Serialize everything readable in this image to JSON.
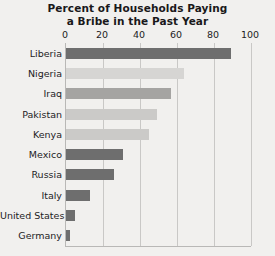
{
  "chart_data": {
    "type": "bar",
    "orientation": "horizontal",
    "title": "Percent of Households Paying a Bribe in the Past Year",
    "title_lines": [
      "Percent of Households Paying",
      "a Bribe in the Past Year"
    ],
    "xlabel": "",
    "ylabel": "",
    "xlim": [
      0,
      100
    ],
    "xticks": [
      0,
      20,
      40,
      60,
      80,
      100
    ],
    "xtick_labels": [
      "0",
      "20",
      "40",
      "60",
      "80",
      "100"
    ],
    "grid": "vertical",
    "legend": "none",
    "categories": [
      "Liberia",
      "Nigeria",
      "Iraq",
      "Pakistan",
      "Kenya",
      "Mexico",
      "Russia",
      "Italy",
      "United States",
      "Germany"
    ],
    "values": [
      89,
      64,
      57,
      49,
      45,
      31,
      26,
      13,
      5,
      2
    ],
    "bar_colors": [
      "#6e6e6e",
      "#d6d5d3",
      "#a5a4a2",
      "#cbcac8",
      "#cbcac8",
      "#6e6e6e",
      "#6e6e6e",
      "#6e6e6e",
      "#6e6e6e",
      "#6e6e6e"
    ]
  },
  "style": {
    "background": "#f1f0ee",
    "text_color": "#1d1c1e",
    "gridline_color": "#c9c8c6",
    "axis_color": "#b9b8b6"
  }
}
